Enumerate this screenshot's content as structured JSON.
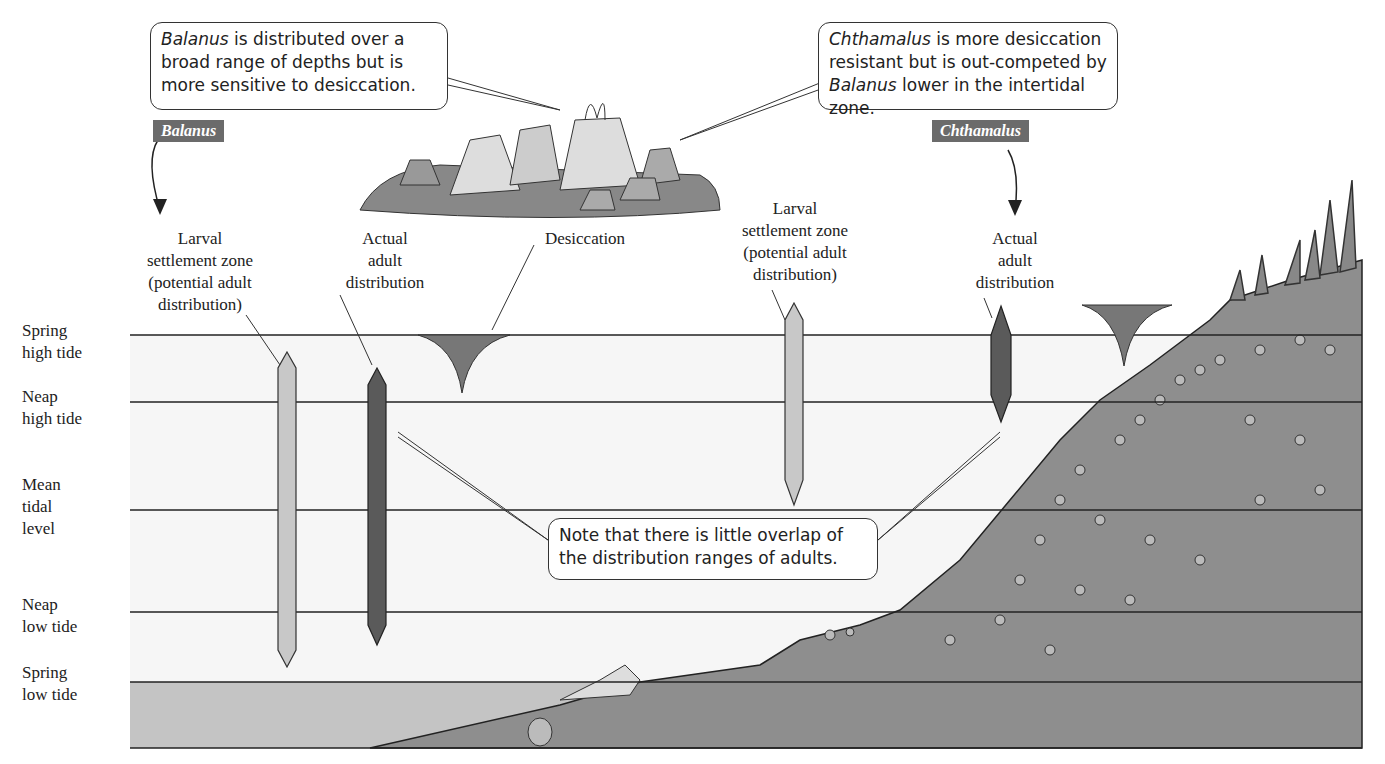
{
  "callouts": {
    "balanus": {
      "italic": "Balanus",
      "rest": " is distributed over a broad range of depths but is more sensitive to desiccation."
    },
    "chthamalus": {
      "italic": "Chthamalus",
      "rest1": " is more desiccation resistant but is out-competed by ",
      "italic2": "Balanus",
      "rest2": " lower in the intertidal zone."
    },
    "overlap": "Note that there is little overlap of the distribution ranges of adults."
  },
  "species_tags": {
    "balanus": "Balanus",
    "chthamalus": "Chthamalus"
  },
  "labels": {
    "balanus_larval": [
      "Larval",
      "settlement zone",
      "(potential adult",
      "distribution)"
    ],
    "balanus_actual": [
      "Actual",
      "adult",
      "distribution"
    ],
    "desiccation": "Desiccation",
    "chthamalus_larval": [
      "Larval",
      "settlement zone",
      "(potential adult",
      "distribution)"
    ],
    "chthamalus_actual": [
      "Actual",
      "adult",
      "distribution"
    ]
  },
  "tide_levels": [
    {
      "lines": [
        "Spring",
        "high tide"
      ],
      "y": 335
    },
    {
      "lines": [
        "Neap",
        "high tide"
      ],
      "y": 402
    },
    {
      "lines": [
        "Mean",
        "tidal",
        "level"
      ],
      "y": 510
    },
    {
      "lines": [
        "Neap",
        "low tide"
      ],
      "y": 612
    },
    {
      "lines": [
        "Spring",
        "low tide"
      ],
      "y": 682
    }
  ],
  "colors": {
    "tag_bg": "#6b6b6b",
    "light_bar": "#c8c8c8",
    "dark_bar": "#5a5a5a",
    "desiccation": "#777777",
    "rock": "#8a8a8a",
    "water_low": "#c4c4c4"
  }
}
